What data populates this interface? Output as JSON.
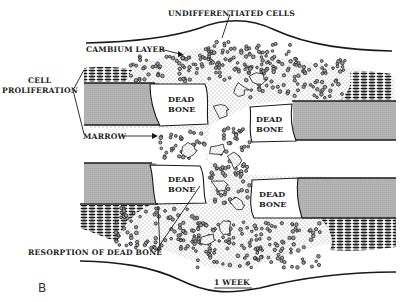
{
  "figure": {
    "panel_letter": "B",
    "time_label": "1 WEEK",
    "colors": {
      "ink": "#1a1a1a",
      "cortex_grey": "#b4b4b4",
      "dead_bone": "#ffffff",
      "background": "#ffffff"
    }
  },
  "labels": {
    "undifferentiated_cells": "UNDIFFERENTIATED CELLS",
    "cambium_layer": "CAMBIUM LAYER",
    "cell_proliferation_line1": "CELL",
    "cell_proliferation_line2": "PROLIFERATION",
    "marrow": "MARROW",
    "resorption": "RESORPTION OF DEAD BONE"
  },
  "dead_bone_regions": [
    {
      "line1": "DEAD",
      "line2": "BONE",
      "position": "upper-left"
    },
    {
      "line1": "DEAD",
      "line2": "BONE",
      "position": "upper-right"
    },
    {
      "line1": "DEAD",
      "line2": "BONE",
      "position": "lower-left"
    },
    {
      "line1": "DEAD",
      "line2": "BONE",
      "position": "lower-right"
    }
  ]
}
